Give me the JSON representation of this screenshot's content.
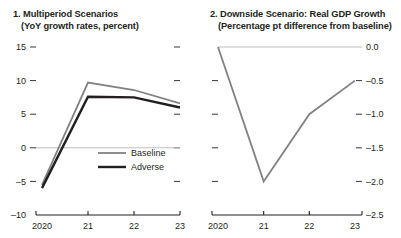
{
  "figure": {
    "background_color": "#ffffff",
    "text_color": "#231f20"
  },
  "panels": [
    {
      "id": "panel-1",
      "title_line_1": "1. Multiperiod Scenarios",
      "title_line_2": "(YoY growth rates, percent)"
    },
    {
      "id": "panel-2",
      "title_line_1": "2. Downside Scenario: Real GDP Growth",
      "title_line_2": "(Percentage pt difference from baseline)"
    }
  ],
  "chart_data": [
    {
      "type": "line",
      "title": "1. Multiperiod Scenarios",
      "subtitle": "(YoY growth rates, percent)",
      "xlabel": "",
      "ylabel": "",
      "x": [
        "2020",
        "21",
        "22",
        "23"
      ],
      "xtick_labels": [
        "2020",
        "21",
        "22",
        "23"
      ],
      "ytick_labels": [
        "15",
        "10",
        "5",
        "0",
        "-5",
        "-10"
      ],
      "ytick_values": [
        15,
        10,
        5,
        0,
        -5,
        -10
      ],
      "ylim": [
        -10,
        15
      ],
      "grid": false,
      "zero_line": true,
      "y_axis_side": "left",
      "right_ticks": true,
      "legend_position": "inside-lower-right",
      "series": [
        {
          "name": "Baseline",
          "color": "#808285",
          "width": 1.8,
          "values": [
            -5.5,
            9.7,
            8.6,
            6.6
          ]
        },
        {
          "name": "Adverse",
          "color": "#231f20",
          "width": 2.4,
          "values": [
            -6.0,
            7.6,
            7.5,
            6.0
          ]
        }
      ]
    },
    {
      "type": "line",
      "title": "2. Downside Scenario: Real GDP Growth",
      "subtitle": "(Percentage pt difference from baseline)",
      "xlabel": "",
      "ylabel": "",
      "x": [
        "2020",
        "21",
        "22",
        "23"
      ],
      "xtick_labels": [
        "2020",
        "21",
        "22",
        "23"
      ],
      "ytick_labels": [
        "0.0",
        "-0.5",
        "-1.0",
        "-1.5",
        "-2.0",
        "-2.5"
      ],
      "ytick_values": [
        0.0,
        -0.5,
        -1.0,
        -1.5,
        -2.0,
        -2.5
      ],
      "ylim": [
        -2.5,
        0.0
      ],
      "grid": false,
      "zero_line": false,
      "y_axis_side": "right",
      "left_ticks": true,
      "legend_position": "none",
      "series": [
        {
          "name": "Downside",
          "color": "#808285",
          "width": 1.8,
          "values": [
            0.0,
            -2.0,
            -1.0,
            -0.5
          ]
        }
      ]
    }
  ],
  "legend": {
    "items": [
      {
        "label": "Baseline",
        "color": "#808285"
      },
      {
        "label": "Adverse",
        "color": "#231f20"
      }
    ]
  }
}
